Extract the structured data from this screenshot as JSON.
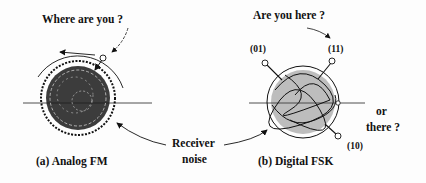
{
  "panel_a": {
    "question": "Where are you ?",
    "caption": "(a) Analog FM"
  },
  "panel_b": {
    "question": "Are you here ?",
    "caption": "(b) Digital FSK",
    "alt_question_line1": "or",
    "alt_question_line2": "there ?",
    "states": {
      "s01": "(01)",
      "s11": "(11)",
      "s10": "(10)"
    }
  },
  "shared": {
    "noise_label_line1": "Receiver",
    "noise_label_line2": "noise"
  }
}
